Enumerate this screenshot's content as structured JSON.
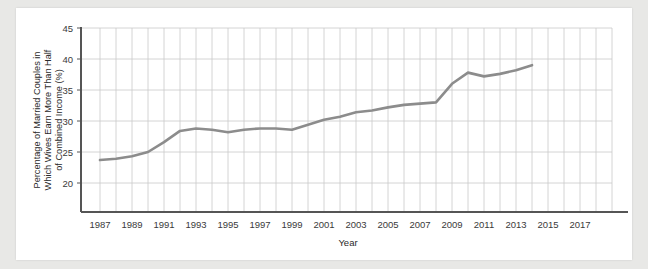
{
  "chart_data": {
    "type": "line",
    "title": "",
    "xlabel": "Year",
    "ylabel": "Percentage of Married Couples in Which Wives Earn More Than Half of Combined Income (%)",
    "ylabel_lines": [
      "Percentage of Married Couples in",
      "Which Wives Earn More Than Half",
      "of Combined Income (%)"
    ],
    "xlim": [
      1986,
      2017
    ],
    "ylim": [
      18,
      45
    ],
    "xticks": [
      1987,
      1989,
      1991,
      1993,
      1995,
      1997,
      1999,
      2001,
      2003,
      2005,
      2007,
      2009,
      2011,
      2013,
      2015,
      2017
    ],
    "yticks": [
      20,
      25,
      30,
      35,
      40,
      45
    ],
    "grid": true,
    "legend": "none",
    "series": [
      {
        "name": "Wives earning more than half of combined income",
        "color": "#8c8c8c",
        "x": [
          1987,
          1988,
          1989,
          1990,
          1991,
          1992,
          1993,
          1994,
          1995,
          1996,
          1997,
          1998,
          1999,
          2000,
          2001,
          2002,
          2003,
          2004,
          2005,
          2006,
          2007,
          2008,
          2009,
          2010,
          2011,
          2012,
          2013,
          2014
        ],
        "values": [
          23.7,
          23.9,
          24.3,
          25.0,
          26.6,
          28.4,
          28.8,
          28.6,
          28.2,
          28.6,
          28.8,
          28.8,
          28.6,
          29.4,
          30.2,
          30.7,
          31.4,
          31.7,
          32.2,
          32.6,
          32.8,
          33.0,
          36.0,
          37.8,
          37.2,
          37.6,
          38.2,
          39.0
        ]
      }
    ]
  },
  "axis": {
    "ytick_labels": [
      "45",
      "40",
      "35",
      "30",
      "25",
      "20"
    ],
    "xtick_labels": [
      "1987",
      "1989",
      "1991",
      "1993",
      "1995",
      "1997",
      "1999",
      "2001",
      "2003",
      "2005",
      "2007",
      "2009",
      "2011",
      "2013",
      "2015",
      "2017"
    ],
    "x_axis_title": "Year"
  },
  "colors": {
    "page_background": "#e8e8e6",
    "card_background": "#ffffff",
    "line": "#8c8c8c",
    "grid": "#c9c9c9",
    "axis": "#555555",
    "text": "#2a2a2a"
  }
}
